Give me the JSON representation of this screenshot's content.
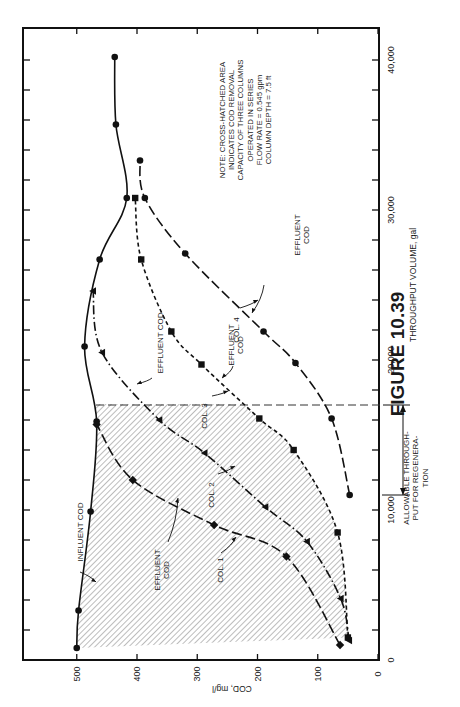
{
  "figure": {
    "caption": "FIGURE 10.39"
  },
  "chart_data": {
    "type": "line",
    "orientation": "rotated 90° counter-clockwise (x axis vertical on right, y axis horizontal at bottom)",
    "title": "",
    "xlabel": "THROUGHPUT VOLUME, gal",
    "ylabel": "COD, mg/l",
    "xlim": [
      0,
      40000
    ],
    "ylim": [
      0,
      590
    ],
    "x_ticks": [
      0,
      10000,
      20000,
      30000,
      40000
    ],
    "x_tick_labels": [
      "0",
      "10,000",
      "20,000",
      "30,000",
      "40,000"
    ],
    "x_minor_tick_step": 2000,
    "y_ticks": [
      0,
      100,
      200,
      300,
      400,
      500
    ],
    "y_tick_labels": [
      "0",
      "100",
      "200",
      "300",
      "400",
      "500"
    ],
    "grid": false,
    "series": [
      {
        "name": "Influent COD",
        "style": "solid",
        "marker": "circle",
        "points": [
          [
            800,
            500
          ],
          [
            3300,
            497
          ],
          [
            9900,
            477
          ],
          [
            15900,
            467
          ],
          [
            20900,
            487
          ],
          [
            26700,
            462
          ],
          [
            30800,
            417
          ],
          [
            35700,
            435
          ],
          [
            40200,
            437
          ]
        ]
      },
      {
        "name": "Col. 1 Effluent COD",
        "style": "long-dash",
        "marker": "diamond",
        "points": [
          [
            1000,
            63
          ],
          [
            6900,
            152
          ],
          [
            9000,
            272
          ],
          [
            12000,
            407
          ],
          [
            15700,
            467
          ]
        ]
      },
      {
        "name": "Col. 2 Effluent COD",
        "style": "dash-dot",
        "marker": "triangle",
        "points": [
          [
            1300,
            48
          ],
          [
            4100,
            62
          ],
          [
            7900,
            118
          ],
          [
            10200,
            187
          ],
          [
            13800,
            288
          ],
          [
            16000,
            363
          ],
          [
            20500,
            458
          ],
          [
            24600,
            473
          ]
        ]
      },
      {
        "name": "Col. 3 Effluent COD",
        "style": "short-dash",
        "marker": "square",
        "points": [
          [
            1500,
            50
          ],
          [
            8500,
            67
          ],
          [
            14000,
            140
          ],
          [
            16100,
            197
          ],
          [
            19700,
            293
          ],
          [
            21900,
            343
          ],
          [
            26700,
            393
          ],
          [
            30800,
            403
          ]
        ]
      },
      {
        "name": "Col. 4 Effluent COD",
        "style": "long-dash",
        "marker": "circle",
        "points": [
          [
            11000,
            47
          ],
          [
            16100,
            77
          ],
          [
            19800,
            137
          ],
          [
            21900,
            190
          ],
          [
            27100,
            320
          ],
          [
            30800,
            387
          ],
          [
            33300,
            395
          ]
        ]
      }
    ],
    "annotations": [
      {
        "text": "INFLUENT COD",
        "target": "Influent COD"
      },
      {
        "text": "EFFLUENT COD",
        "target": "Col. 1 Effluent COD"
      },
      {
        "text": "COL. 1",
        "target": "Col. 1 Effluent COD"
      },
      {
        "text": "EFFLUENT COD",
        "target": "Col. 2 Effluent COD"
      },
      {
        "text": "COL. 2",
        "target": "Col. 2 Effluent COD"
      },
      {
        "text": "EFFLUENT COD",
        "target": "Col. 3 Effluent COD"
      },
      {
        "text": "COL. 3",
        "target": "Col. 3 Effluent COD"
      },
      {
        "text": "EFFLUENT COD",
        "target": "Col. 4 Effluent COD"
      },
      {
        "text": "COL. 4",
        "target": "Col. 4 Effluent COD"
      },
      {
        "text": "ALLOWABLE THROUGH-PUT FOR REGENERA-TION",
        "x_range": [
          11000,
          17000
        ]
      }
    ],
    "hatched_region": {
      "description": "Between influent COD and column 3 effluent COD, throughput 0–17,000 gal",
      "x_max": 17000
    },
    "vertical_dashed_line_x": 17000,
    "note": {
      "lines": [
        "NOTE:  CROSS-HATCHED AREA",
        "INDICATES COD REMOVAL",
        "CAPACITY OF THREE COLUMNS",
        "OPERATED IN SERIES",
        "",
        "FLOW RATE = 0.545 gpm",
        "COLUMN DEPTH = 7.5 ft"
      ]
    },
    "labels": {
      "influent": "INFLUENT COD",
      "effluent": "EFFLUENT COD",
      "effluent_line1": "EFFLUENT",
      "effluent_line2": "COD",
      "col1": "COL. 1",
      "col2": "COL. 2",
      "col3": "COL. 3",
      "col4": "COL. 4",
      "allowable": [
        "ALLOWABLE THROUGH-",
        "PUT FOR REGENERA-",
        "TION"
      ]
    }
  }
}
